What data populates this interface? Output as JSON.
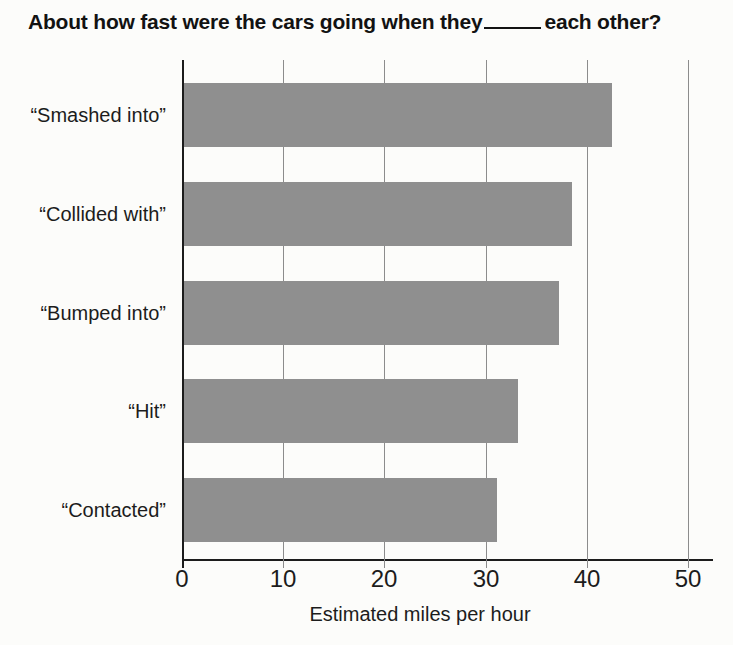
{
  "title": {
    "prefix": "About how fast were the cars going when they",
    "suffix": "each other?"
  },
  "chart_data": {
    "type": "bar",
    "orientation": "horizontal",
    "categories": [
      "“Smashed into”",
      "“Collided with”",
      "“Bumped into”",
      "“Hit”",
      "“Contacted”"
    ],
    "values": [
      42.5,
      38.5,
      37.3,
      33.2,
      31.1
    ],
    "xlabel": "Estimated miles per hour",
    "ylabel": "",
    "x_ticks": [
      0,
      10,
      20,
      30,
      40,
      50
    ],
    "xlim": [
      0,
      52.3
    ],
    "grid": "vertical-gridlines-behind-bars",
    "legend": "none",
    "colors": {
      "bar": "#8f8f8f",
      "axis": "#1c1c1c",
      "gridline": "#8c8c8c",
      "text": "#1c1c1c",
      "background": "#fcfcfa"
    }
  }
}
